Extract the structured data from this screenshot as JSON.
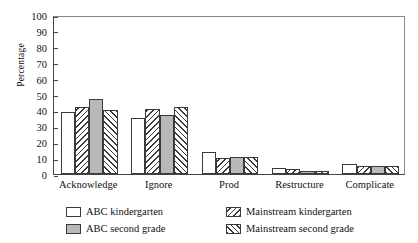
{
  "chart_data": {
    "type": "bar",
    "title": "",
    "xlabel": "",
    "ylabel": "Percentage",
    "ylim": [
      0,
      100
    ],
    "ytick_step": 10,
    "yticks": [
      0,
      10,
      20,
      30,
      40,
      50,
      60,
      70,
      80,
      90,
      100
    ],
    "grid": false,
    "legend_position": "bottom",
    "categories": [
      "Acknowledge",
      "Ignore",
      "Prod",
      "Restructure",
      "Complicate"
    ],
    "series": [
      {
        "name": "ABC kindergarten",
        "style": "white",
        "color": "#ffffff",
        "values": [
          39,
          35,
          14,
          4,
          6
        ]
      },
      {
        "name": "Mainstream kindergarten",
        "style": "back-hatch",
        "color": "#ffffff",
        "values": [
          42,
          41,
          10,
          3,
          5
        ]
      },
      {
        "name": "ABC second grade",
        "style": "gray",
        "color": "#b9b9b9",
        "values": [
          47,
          37,
          11,
          2,
          5
        ]
      },
      {
        "name": "Mainstream second grade",
        "style": "forward-hatch",
        "color": "#ffffff",
        "values": [
          40,
          42,
          11,
          2,
          5
        ]
      }
    ]
  },
  "legend": {
    "entries": [
      {
        "label": "ABC kindergarten",
        "swatch": "white"
      },
      {
        "label": "Mainstream kindergarten",
        "swatch": "back-hatch"
      },
      {
        "label": "ABC second grade",
        "swatch": "gray"
      },
      {
        "label": "Mainstream second grade",
        "swatch": "forward-hatch"
      }
    ]
  },
  "colors": {
    "axis": "#444444",
    "bar_outline": "#3a3a3a",
    "gray_fill": "#b9b9b9",
    "white_fill": "#ffffff",
    "background": "#ffffff"
  }
}
